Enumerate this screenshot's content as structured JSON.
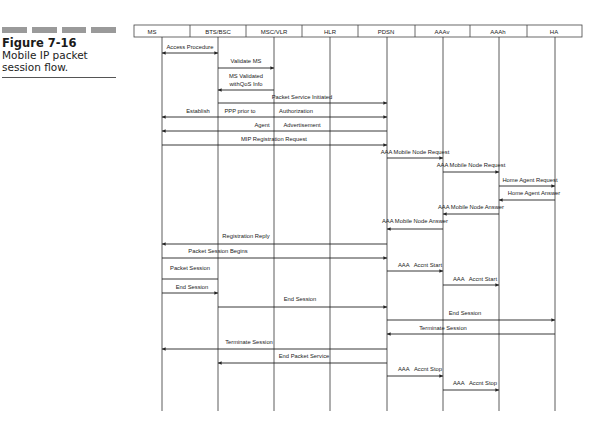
{
  "caption": {
    "figure": "Figure 7-16",
    "line1": "Mobile IP packet",
    "line2": "session flow."
  },
  "entities": [
    "MS",
    "BTS/BSC",
    "MSC/VLR",
    "HLR",
    "PDSN",
    "AAAv",
    "AAAh",
    "HA"
  ],
  "messages": [
    {
      "label": "Access Procedure",
      "from": "MS",
      "to": "BTS/BSC",
      "bidirectional": true
    },
    {
      "label": "Validate MS",
      "from": "BTS/BSC",
      "to": "MSC/VLR"
    },
    {
      "label": "MS Validated withQoS Info",
      "from": "MSC/VLR",
      "to": "BTS/BSC"
    },
    {
      "label": "Packet Service Initiated",
      "from": "BTS/BSC",
      "to": "PDSN"
    },
    {
      "label": "Establish PPP prior to Authorization",
      "from": "MS",
      "to": "PDSN",
      "bidirectional": true
    },
    {
      "label": "Agent Advertisement",
      "from": "PDSN",
      "to": "MS"
    },
    {
      "label": "MIP Registration Request",
      "from": "MS",
      "to": "PDSN"
    },
    {
      "label": "AAA Mobile Node Request",
      "from": "PDSN",
      "to": "AAAv"
    },
    {
      "label": "AAA Mobile Node Request",
      "from": "AAAv",
      "to": "AAAh"
    },
    {
      "label": "Home Agent Request",
      "from": "AAAh",
      "to": "HA"
    },
    {
      "label": "Home Agent Answer",
      "from": "HA",
      "to": "AAAh"
    },
    {
      "label": "AAA Mobile Node Answer",
      "from": "AAAh",
      "to": "AAAv"
    },
    {
      "label": "AAA Mobile Node Answer",
      "from": "AAAv",
      "to": "PDSN"
    },
    {
      "label": "Registration Reply",
      "from": "PDSN",
      "to": "MS"
    },
    {
      "label": "Packet Session Begins",
      "from": "MS",
      "to": "PDSN"
    },
    {
      "label": "Packet Session",
      "from": "MS",
      "to": "BTS/BSC",
      "type": "box"
    },
    {
      "label": "AAA Accnt Start",
      "from": "PDSN",
      "to": "AAAv"
    },
    {
      "label": "AAA Accnt Start",
      "from": "AAAv",
      "to": "AAAh"
    },
    {
      "label": "End Session",
      "from": "MS",
      "to": "BTS/BSC"
    },
    {
      "label": "End Session",
      "from": "BTS/BSC",
      "to": "PDSN"
    },
    {
      "label": "End Session",
      "from": "PDSN",
      "to": "HA"
    },
    {
      "label": "Terminate Session",
      "from": "HA",
      "to": "PDSN"
    },
    {
      "label": "Terminate Session",
      "from": "PDSN",
      "to": "MS"
    },
    {
      "label": "End Packet Service",
      "from": "PDSN",
      "to": "BTS/BSC"
    },
    {
      "label": "AAA Accnt Stop",
      "from": "PDSN",
      "to": "AAAv"
    },
    {
      "label": "AAA Accnt Stop",
      "from": "AAAv",
      "to": "AAAh"
    }
  ],
  "labels": {
    "access": "Access Procedure",
    "validate": "Validate MS",
    "validated1": "MS Validated",
    "validated2": "withQoS Info",
    "pktInit": "Packet Service Initiated",
    "ppp1": "Establish",
    "ppp2": "PPP prior to",
    "ppp3": "Authorization",
    "agent1": "Agent",
    "agent2": "Advertisement",
    "mip": "MIP Registration Request",
    "mnr1": "AAA Mobile Node Request",
    "mnr2": "AAA Mobile Node Request",
    "har": "Home Agent Request",
    "haa": "Home Agent Answer",
    "mna1": "AAA Mobile Node Answer",
    "mna2": "AAA Mobile Node Answer",
    "regReply": "Registration Reply",
    "pktBegins": "Packet Session Begins",
    "pktSession": "Packet Session",
    "startA1": "AAA",
    "startB1": "Accnt Start",
    "startA2": "AAA",
    "startB2": "Accnt Start",
    "end1": "End Session",
    "end2": "End Session",
    "end3": "End Session",
    "term1": "Terminate Session",
    "term2": "Terminate Session",
    "endPkt": "End Packet Service",
    "stopA1": "AAA",
    "stopB1": "Accnt Stop",
    "stopA2": "AAA",
    "stopB2": "Accnt Stop"
  }
}
